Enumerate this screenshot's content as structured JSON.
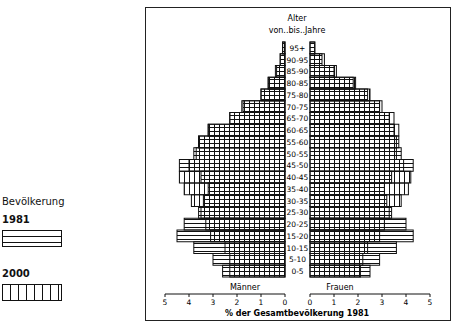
{
  "legend": {
    "title": "Bevölkerung",
    "series": [
      {
        "label": "1981",
        "pattern": "horizontal-lines"
      },
      {
        "label": "2000",
        "pattern": "vertical-lines"
      }
    ]
  },
  "chart_data": {
    "type": "bar",
    "subtype": "population-pyramid",
    "age_axis_title_line1": "Alter",
    "age_axis_title_line2": "von..bis..Jahre",
    "xlabel": "% der Gesamtbevölkerung 1981",
    "left_label": "Männer",
    "right_label": "Frauen",
    "xlim": [
      0,
      5
    ],
    "xticks": [
      0,
      1,
      2,
      3,
      4,
      5
    ],
    "grid": false,
    "legend_position": "left",
    "categories": [
      "0-5",
      "5-10",
      "10-15",
      "15-20",
      "20-25",
      "25-30",
      "30-35",
      "35-40",
      "40-45",
      "45-50",
      "50-55",
      "55-60",
      "60-65",
      "65-70",
      "70-75",
      "75-80",
      "80-85",
      "85-90",
      "90-95",
      "95+"
    ],
    "series": [
      {
        "name": "Männer 1981",
        "values": [
          2.6,
          3.0,
          3.8,
          4.5,
          4.2,
          3.6,
          3.4,
          3.2,
          3.5,
          4.4,
          3.8,
          3.6,
          3.2,
          2.3,
          1.75,
          1.0,
          0.7,
          0.35,
          0.2,
          0.1
        ]
      },
      {
        "name": "Männer 2000",
        "values": [
          2.3,
          2.3,
          2.5,
          3.1,
          3.3,
          3.5,
          3.9,
          4.2,
          4.4,
          4.0,
          3.7,
          3.6,
          3.2,
          2.3,
          1.8,
          1.0,
          0.7,
          0.4,
          0.2,
          0.1
        ]
      },
      {
        "name": "Frauen 1981",
        "values": [
          2.5,
          2.9,
          3.6,
          4.3,
          4.0,
          3.4,
          3.2,
          3.1,
          3.4,
          4.3,
          3.8,
          3.7,
          3.5,
          3.3,
          2.9,
          2.4,
          1.8,
          1.0,
          0.5,
          0.2
        ]
      },
      {
        "name": "Frauen 2000",
        "values": [
          2.1,
          2.2,
          2.4,
          2.9,
          3.1,
          3.3,
          3.8,
          4.1,
          4.2,
          3.9,
          3.6,
          3.6,
          3.7,
          3.5,
          3.0,
          2.5,
          1.9,
          1.1,
          0.6,
          0.2
        ]
      }
    ]
  }
}
